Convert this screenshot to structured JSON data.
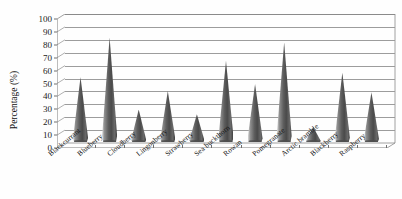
{
  "chart_data": {
    "type": "bar",
    "title": "",
    "subtitle": "",
    "xlabel": "",
    "ylabel": "Percentage (%)",
    "ylim": [
      0,
      100
    ],
    "ytick_step": 10,
    "yticks": [
      100,
      90,
      80,
      70,
      60,
      50,
      40,
      30,
      20,
      10,
      0
    ],
    "grid": true,
    "legend": "none",
    "style": "3d-cone",
    "series_color": "#555555",
    "categories": [
      "Blackcurrant",
      "Blueberry",
      "Cloudberry",
      "Lingonberry",
      "Strawberry",
      "Sea buckthorn",
      "Rowan",
      "Pomegranate",
      "Arctic bramble",
      "Blackberry",
      "Raspberry"
    ],
    "values": [
      56,
      90,
      28,
      44,
      24,
      70,
      50,
      86,
      13,
      60,
      43
    ]
  },
  "axes": {
    "y_title": "Percentage (%)"
  }
}
